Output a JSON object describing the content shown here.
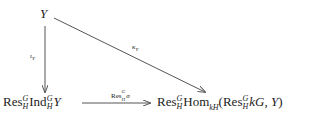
{
  "nodes": {
    "top": {
      "text": "Y"
    },
    "bottom_left": {
      "res": "Res",
      "G": "G",
      "H": "H",
      "ind": "Ind",
      "y": "Y"
    },
    "bottom_right": {
      "res": "Res",
      "G": "G",
      "H": "H",
      "hom": "Hom",
      "hom_sub": "kH",
      "open": "(",
      "res2": "Res",
      "kG": "kG, ",
      "y": "Y",
      "close": ")"
    }
  },
  "arrows": {
    "vertical": {
      "label_main": "ι",
      "label_sub": "Y"
    },
    "diagonal": {
      "label_main": "κ",
      "label_sub": "Y"
    },
    "horizontal": {
      "label_res": "Res",
      "label_G": "G",
      "label_H": "H",
      "label_sigma": "σ"
    }
  },
  "colors": {
    "stroke": "#555555",
    "text": "#222222"
  }
}
